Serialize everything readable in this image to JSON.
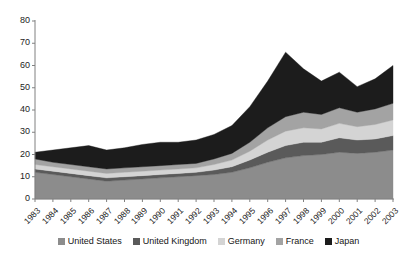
{
  "chart_data": {
    "type": "area",
    "stacked": true,
    "title": "",
    "xlabel": "",
    "ylabel": "",
    "ylim": [
      0,
      80
    ],
    "ytick_step": 10,
    "yticks": [
      0,
      10,
      20,
      30,
      40,
      50,
      60,
      70,
      80
    ],
    "grid": false,
    "legend_position": "bottom",
    "categories": [
      "1983",
      "1984",
      "1985",
      "1986",
      "1987",
      "1988",
      "1989",
      "1990",
      "1991",
      "1992",
      "1993",
      "1994",
      "1995",
      "1996",
      "1997",
      "1998",
      "1999",
      "2000",
      "2001",
      "2002",
      "2003"
    ],
    "series": [
      {
        "name": "United States",
        "color": "#8c8c8c",
        "values": [
          12.0,
          11.0,
          10.0,
          9.0,
          8.0,
          8.5,
          9.0,
          9.5,
          10.0,
          10.5,
          11.0,
          12.0,
          14.0,
          16.5,
          18.5,
          19.5,
          20.0,
          21.0,
          20.5,
          21.0,
          22.0
        ]
      },
      {
        "name": "United Kingdom",
        "color": "#5a5a5a",
        "values": [
          1.5,
          1.5,
          1.5,
          1.5,
          1.5,
          1.5,
          1.5,
          1.5,
          1.5,
          1.5,
          2.0,
          2.5,
          3.5,
          4.5,
          5.5,
          6.0,
          5.5,
          6.5,
          6.0,
          6.0,
          6.5
        ]
      },
      {
        "name": "Germany",
        "color": "#d4d4d4",
        "values": [
          2.0,
          2.0,
          2.0,
          2.0,
          2.0,
          2.0,
          2.0,
          2.0,
          2.0,
          2.0,
          2.5,
          3.0,
          4.0,
          5.5,
          6.5,
          6.5,
          6.0,
          6.5,
          6.0,
          6.5,
          7.0
        ]
      },
      {
        "name": "France",
        "color": "#a3a3a3",
        "values": [
          2.5,
          2.0,
          2.0,
          2.0,
          2.0,
          2.0,
          2.0,
          2.0,
          2.0,
          2.0,
          2.5,
          3.0,
          4.0,
          5.5,
          6.5,
          7.0,
          6.5,
          7.0,
          6.5,
          7.0,
          7.5
        ]
      },
      {
        "name": "Japan",
        "color": "#1c1c1c",
        "values": [
          3.0,
          5.5,
          7.5,
          9.5,
          8.5,
          9.0,
          10.0,
          10.5,
          10.0,
          10.5,
          11.0,
          12.5,
          16.0,
          21.0,
          29.0,
          19.5,
          15.0,
          16.0,
          11.5,
          13.5,
          17.0
        ]
      }
    ],
    "totals": [
      21.0,
      22.0,
      23.0,
      24.0,
      22.0,
      23.0,
      24.5,
      25.5,
      25.5,
      26.5,
      29.0,
      33.0,
      41.5,
      53.0,
      66.0,
      58.5,
      53.0,
      57.0,
      50.5,
      54.0,
      60.0
    ]
  },
  "legend": {
    "items": [
      {
        "label": "United States",
        "color": "#8c8c8c"
      },
      {
        "label": "United Kingdom",
        "color": "#5a5a5a"
      },
      {
        "label": "Germany",
        "color": "#d4d4d4"
      },
      {
        "label": "France",
        "color": "#a3a3a3"
      },
      {
        "label": "Japan",
        "color": "#1c1c1c"
      }
    ]
  },
  "axes": {
    "axis_color": "#808080",
    "tick_color": "#808080"
  }
}
